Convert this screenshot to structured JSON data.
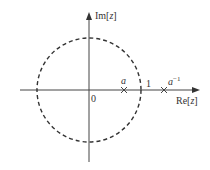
{
  "diagram": {
    "type": "z-plane pole plot",
    "axes": {
      "imag_label_prefix": "Im[",
      "imag_label_var": "z",
      "imag_label_suffix": "]",
      "real_label_prefix": "Re[",
      "real_label_var": "z",
      "real_label_suffix": "]",
      "origin_label": "0"
    },
    "unit_circle": {
      "style": "dashed",
      "radius_label": "1"
    },
    "markers": [
      {
        "symbol": "×",
        "label": "a",
        "position": "inside unit circle on real axis"
      },
      {
        "symbol": "×",
        "label_base": "a",
        "label_sup": "−1",
        "position": "outside unit circle on real axis"
      }
    ],
    "colors": {
      "line": "#333333",
      "background": "#ffffff"
    }
  }
}
